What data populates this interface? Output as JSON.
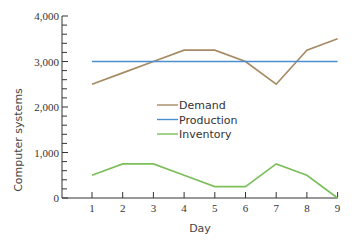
{
  "chart_data": {
    "type": "line",
    "title": "",
    "xlabel": "Day",
    "ylabel": "Computer systems",
    "x": [
      1,
      2,
      3,
      4,
      5,
      6,
      7,
      8,
      9
    ],
    "xticks": [
      "1",
      "2",
      "3",
      "4",
      "5",
      "6",
      "7",
      "8",
      "9"
    ],
    "yticks": [
      "0",
      "1,000",
      "2,000",
      "3,000",
      "4,000"
    ],
    "ylim": [
      0,
      4000
    ],
    "grid": false,
    "legend_position": "center",
    "series": [
      {
        "name": "Demand",
        "color": "#a68a64",
        "values": [
          2500,
          2750,
          3000,
          3250,
          3250,
          3000,
          2500,
          3250,
          3500
        ]
      },
      {
        "name": "Production",
        "color": "#4a8fd0",
        "values": [
          3000,
          3000,
          3000,
          3000,
          3000,
          3000,
          3000,
          3000,
          3000
        ]
      },
      {
        "name": "Inventory",
        "color": "#7cbf5a",
        "values": [
          500,
          750,
          750,
          500,
          250,
          250,
          750,
          500,
          0
        ]
      }
    ]
  }
}
